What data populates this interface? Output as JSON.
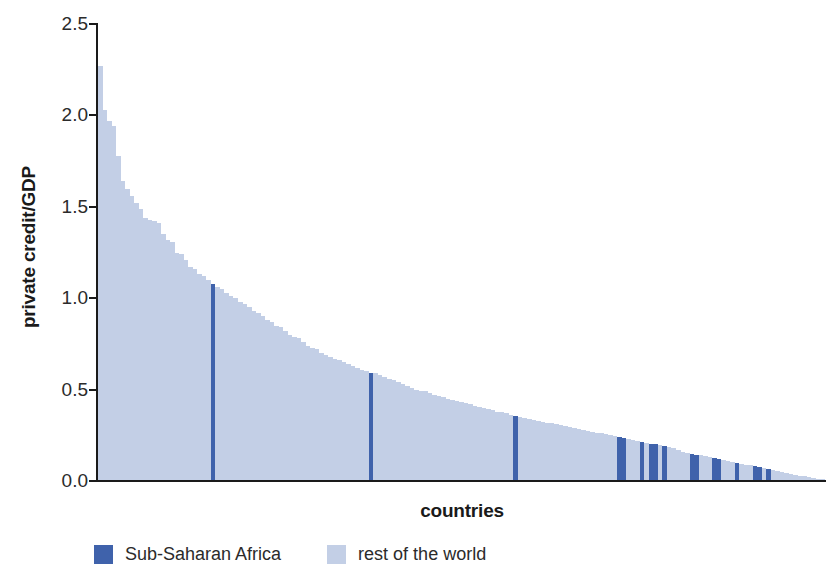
{
  "chart_data": {
    "type": "bar",
    "title": "",
    "xlabel": "countries",
    "ylabel": "private credit/GDP",
    "ylim": [
      0.0,
      2.5
    ],
    "yticks": [
      0.0,
      0.5,
      1.0,
      1.5,
      2.0,
      2.5
    ],
    "ytick_labels": [
      "0.0",
      "0.5",
      "1.0",
      "1.5",
      "2.0",
      "2.5"
    ],
    "grid": false,
    "legend_position": "bottom-left",
    "legend": [
      {
        "name": "Sub-Saharan Africa",
        "color": "#3f62ab"
      },
      {
        "name": "rest of the world",
        "color": "#c3cfe6"
      }
    ],
    "series": [
      {
        "name": "Sub-Saharan Africa",
        "color": "#3f62ab"
      },
      {
        "name": "rest of the world",
        "color": "#c3cfe6"
      }
    ],
    "bars": [
      {
        "value": 2.27,
        "group": "rest of the world"
      },
      {
        "value": 2.03,
        "group": "rest of the world"
      },
      {
        "value": 1.97,
        "group": "rest of the world"
      },
      {
        "value": 1.94,
        "group": "rest of the world"
      },
      {
        "value": 1.78,
        "group": "rest of the world"
      },
      {
        "value": 1.64,
        "group": "rest of the world"
      },
      {
        "value": 1.6,
        "group": "rest of the world"
      },
      {
        "value": 1.56,
        "group": "rest of the world"
      },
      {
        "value": 1.52,
        "group": "rest of the world"
      },
      {
        "value": 1.49,
        "group": "rest of the world"
      },
      {
        "value": 1.44,
        "group": "rest of the world"
      },
      {
        "value": 1.43,
        "group": "rest of the world"
      },
      {
        "value": 1.42,
        "group": "rest of the world"
      },
      {
        "value": 1.41,
        "group": "rest of the world"
      },
      {
        "value": 1.35,
        "group": "rest of the world"
      },
      {
        "value": 1.32,
        "group": "rest of the world"
      },
      {
        "value": 1.31,
        "group": "rest of the world"
      },
      {
        "value": 1.25,
        "group": "rest of the world"
      },
      {
        "value": 1.24,
        "group": "rest of the world"
      },
      {
        "value": 1.21,
        "group": "rest of the world"
      },
      {
        "value": 1.17,
        "group": "rest of the world"
      },
      {
        "value": 1.16,
        "group": "rest of the world"
      },
      {
        "value": 1.13,
        "group": "rest of the world"
      },
      {
        "value": 1.12,
        "group": "rest of the world"
      },
      {
        "value": 1.1,
        "group": "rest of the world"
      },
      {
        "value": 1.08,
        "group": "Sub-Saharan Africa"
      },
      {
        "value": 1.06,
        "group": "rest of the world"
      },
      {
        "value": 1.05,
        "group": "rest of the world"
      },
      {
        "value": 1.03,
        "group": "rest of the world"
      },
      {
        "value": 1.01,
        "group": "rest of the world"
      },
      {
        "value": 1.0,
        "group": "rest of the world"
      },
      {
        "value": 0.98,
        "group": "rest of the world"
      },
      {
        "value": 0.97,
        "group": "rest of the world"
      },
      {
        "value": 0.95,
        "group": "rest of the world"
      },
      {
        "value": 0.93,
        "group": "rest of the world"
      },
      {
        "value": 0.92,
        "group": "rest of the world"
      },
      {
        "value": 0.9,
        "group": "rest of the world"
      },
      {
        "value": 0.88,
        "group": "rest of the world"
      },
      {
        "value": 0.87,
        "group": "rest of the world"
      },
      {
        "value": 0.85,
        "group": "rest of the world"
      },
      {
        "value": 0.84,
        "group": "rest of the world"
      },
      {
        "value": 0.82,
        "group": "rest of the world"
      },
      {
        "value": 0.8,
        "group": "rest of the world"
      },
      {
        "value": 0.79,
        "group": "rest of the world"
      },
      {
        "value": 0.78,
        "group": "rest of the world"
      },
      {
        "value": 0.76,
        "group": "rest of the world"
      },
      {
        "value": 0.74,
        "group": "rest of the world"
      },
      {
        "value": 0.73,
        "group": "rest of the world"
      },
      {
        "value": 0.72,
        "group": "rest of the world"
      },
      {
        "value": 0.7,
        "group": "rest of the world"
      },
      {
        "value": 0.69,
        "group": "rest of the world"
      },
      {
        "value": 0.68,
        "group": "rest of the world"
      },
      {
        "value": 0.67,
        "group": "rest of the world"
      },
      {
        "value": 0.66,
        "group": "rest of the world"
      },
      {
        "value": 0.65,
        "group": "rest of the world"
      },
      {
        "value": 0.64,
        "group": "rest of the world"
      },
      {
        "value": 0.63,
        "group": "rest of the world"
      },
      {
        "value": 0.62,
        "group": "rest of the world"
      },
      {
        "value": 0.61,
        "group": "rest of the world"
      },
      {
        "value": 0.6,
        "group": "rest of the world"
      },
      {
        "value": 0.59,
        "group": "Sub-Saharan Africa"
      },
      {
        "value": 0.59,
        "group": "rest of the world"
      },
      {
        "value": 0.58,
        "group": "rest of the world"
      },
      {
        "value": 0.57,
        "group": "rest of the world"
      },
      {
        "value": 0.56,
        "group": "rest of the world"
      },
      {
        "value": 0.55,
        "group": "rest of the world"
      },
      {
        "value": 0.54,
        "group": "rest of the world"
      },
      {
        "value": 0.53,
        "group": "rest of the world"
      },
      {
        "value": 0.52,
        "group": "rest of the world"
      },
      {
        "value": 0.51,
        "group": "rest of the world"
      },
      {
        "value": 0.5,
        "group": "rest of the world"
      },
      {
        "value": 0.495,
        "group": "rest of the world"
      },
      {
        "value": 0.49,
        "group": "rest of the world"
      },
      {
        "value": 0.48,
        "group": "rest of the world"
      },
      {
        "value": 0.47,
        "group": "rest of the world"
      },
      {
        "value": 0.465,
        "group": "rest of the world"
      },
      {
        "value": 0.46,
        "group": "rest of the world"
      },
      {
        "value": 0.45,
        "group": "rest of the world"
      },
      {
        "value": 0.445,
        "group": "rest of the world"
      },
      {
        "value": 0.44,
        "group": "rest of the world"
      },
      {
        "value": 0.43,
        "group": "rest of the world"
      },
      {
        "value": 0.425,
        "group": "rest of the world"
      },
      {
        "value": 0.42,
        "group": "rest of the world"
      },
      {
        "value": 0.41,
        "group": "rest of the world"
      },
      {
        "value": 0.405,
        "group": "rest of the world"
      },
      {
        "value": 0.4,
        "group": "rest of the world"
      },
      {
        "value": 0.395,
        "group": "rest of the world"
      },
      {
        "value": 0.39,
        "group": "rest of the world"
      },
      {
        "value": 0.38,
        "group": "rest of the world"
      },
      {
        "value": 0.375,
        "group": "rest of the world"
      },
      {
        "value": 0.37,
        "group": "rest of the world"
      },
      {
        "value": 0.36,
        "group": "rest of the world"
      },
      {
        "value": 0.355,
        "group": "Sub-Saharan Africa"
      },
      {
        "value": 0.35,
        "group": "rest of the world"
      },
      {
        "value": 0.345,
        "group": "rest of the world"
      },
      {
        "value": 0.34,
        "group": "rest of the world"
      },
      {
        "value": 0.335,
        "group": "rest of the world"
      },
      {
        "value": 0.33,
        "group": "rest of the world"
      },
      {
        "value": 0.325,
        "group": "rest of the world"
      },
      {
        "value": 0.32,
        "group": "rest of the world"
      },
      {
        "value": 0.315,
        "group": "rest of the world"
      },
      {
        "value": 0.31,
        "group": "rest of the world"
      },
      {
        "value": 0.305,
        "group": "rest of the world"
      },
      {
        "value": 0.3,
        "group": "rest of the world"
      },
      {
        "value": 0.295,
        "group": "rest of the world"
      },
      {
        "value": 0.29,
        "group": "rest of the world"
      },
      {
        "value": 0.285,
        "group": "rest of the world"
      },
      {
        "value": 0.28,
        "group": "rest of the world"
      },
      {
        "value": 0.275,
        "group": "rest of the world"
      },
      {
        "value": 0.27,
        "group": "rest of the world"
      },
      {
        "value": 0.265,
        "group": "rest of the world"
      },
      {
        "value": 0.26,
        "group": "rest of the world"
      },
      {
        "value": 0.255,
        "group": "rest of the world"
      },
      {
        "value": 0.25,
        "group": "rest of the world"
      },
      {
        "value": 0.245,
        "group": "rest of the world"
      },
      {
        "value": 0.24,
        "group": "Sub-Saharan Africa"
      },
      {
        "value": 0.235,
        "group": "Sub-Saharan Africa"
      },
      {
        "value": 0.23,
        "group": "rest of the world"
      },
      {
        "value": 0.225,
        "group": "rest of the world"
      },
      {
        "value": 0.22,
        "group": "rest of the world"
      },
      {
        "value": 0.215,
        "group": "Sub-Saharan Africa"
      },
      {
        "value": 0.21,
        "group": "rest of the world"
      },
      {
        "value": 0.205,
        "group": "Sub-Saharan Africa"
      },
      {
        "value": 0.2,
        "group": "Sub-Saharan Africa"
      },
      {
        "value": 0.195,
        "group": "rest of the world"
      },
      {
        "value": 0.19,
        "group": "Sub-Saharan Africa"
      },
      {
        "value": 0.185,
        "group": "rest of the world"
      },
      {
        "value": 0.18,
        "group": "rest of the world"
      },
      {
        "value": 0.17,
        "group": "rest of the world"
      },
      {
        "value": 0.16,
        "group": "rest of the world"
      },
      {
        "value": 0.155,
        "group": "rest of the world"
      },
      {
        "value": 0.15,
        "group": "Sub-Saharan Africa"
      },
      {
        "value": 0.145,
        "group": "Sub-Saharan Africa"
      },
      {
        "value": 0.14,
        "group": "rest of the world"
      },
      {
        "value": 0.135,
        "group": "rest of the world"
      },
      {
        "value": 0.13,
        "group": "rest of the world"
      },
      {
        "value": 0.125,
        "group": "Sub-Saharan Africa"
      },
      {
        "value": 0.12,
        "group": "Sub-Saharan Africa"
      },
      {
        "value": 0.115,
        "group": "rest of the world"
      },
      {
        "value": 0.11,
        "group": "rest of the world"
      },
      {
        "value": 0.105,
        "group": "rest of the world"
      },
      {
        "value": 0.1,
        "group": "Sub-Saharan Africa"
      },
      {
        "value": 0.095,
        "group": "rest of the world"
      },
      {
        "value": 0.09,
        "group": "rest of the world"
      },
      {
        "value": 0.085,
        "group": "rest of the world"
      },
      {
        "value": 0.08,
        "group": "Sub-Saharan Africa"
      },
      {
        "value": 0.075,
        "group": "Sub-Saharan Africa"
      },
      {
        "value": 0.07,
        "group": "rest of the world"
      },
      {
        "value": 0.065,
        "group": "Sub-Saharan Africa"
      },
      {
        "value": 0.06,
        "group": "rest of the world"
      },
      {
        "value": 0.055,
        "group": "rest of the world"
      },
      {
        "value": 0.05,
        "group": "rest of the world"
      },
      {
        "value": 0.045,
        "group": "rest of the world"
      },
      {
        "value": 0.04,
        "group": "rest of the world"
      },
      {
        "value": 0.035,
        "group": "rest of the world"
      },
      {
        "value": 0.03,
        "group": "rest of the world"
      },
      {
        "value": 0.025,
        "group": "rest of the world"
      },
      {
        "value": 0.02,
        "group": "rest of the world"
      },
      {
        "value": 0.015,
        "group": "rest of the world"
      },
      {
        "value": 0.012,
        "group": "rest of the world"
      },
      {
        "value": 0.01,
        "group": "rest of the world"
      }
    ]
  }
}
